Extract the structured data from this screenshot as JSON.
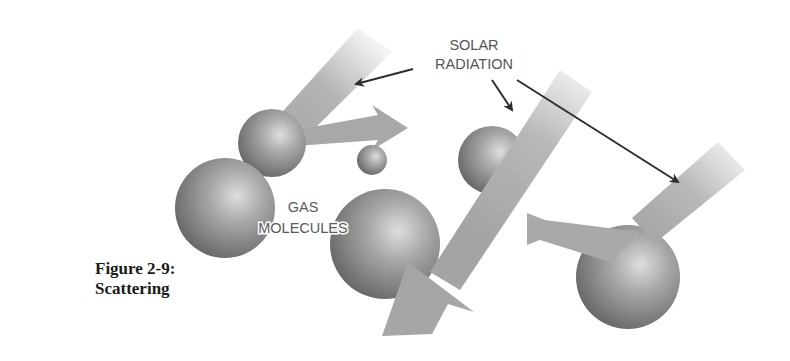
{
  "figure": {
    "caption_line1": "Figure 2-9:",
    "caption_line2": "Scattering",
    "labels": {
      "solar_line1": "SOLAR",
      "solar_line2": "RADIATION",
      "gas_line1": "GAS",
      "gas_line2": "MOLECULES"
    },
    "colors": {
      "beam": "#a8a8a8",
      "beam_fade": "#e6e6e6",
      "sphere_light": "#d2d2d2",
      "sphere_dark": "#5e5e5e",
      "pointer": "#2e2e2e",
      "label_text": "#555555",
      "caption_text": "#1a1a1a"
    }
  }
}
